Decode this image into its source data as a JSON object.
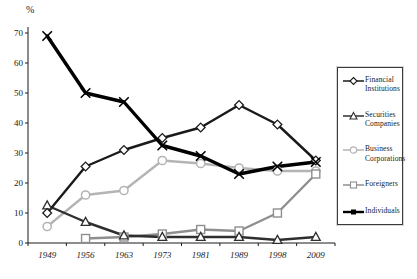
{
  "chart_data": {
    "type": "line",
    "title": "",
    "unit_label": "%",
    "xlabel": "",
    "ylabel": "%",
    "ylim": [
      0,
      70
    ],
    "yticks": [
      0,
      10,
      20,
      30,
      40,
      50,
      60,
      70
    ],
    "grid": false,
    "legend_position": "right",
    "categories": [
      "1949",
      "1956",
      "1963",
      "1973",
      "1981",
      "1989",
      "1998",
      "2009"
    ],
    "series": [
      {
        "name": "Business Corporations",
        "marker": "circle",
        "color": "#b4b4b4",
        "line_width": 2.4,
        "values": [
          5.5,
          16,
          17.5,
          27.5,
          26.5,
          25,
          24,
          24
        ]
      },
      {
        "name": "Foreigners",
        "marker": "square",
        "color": "#8f8f8f",
        "line_width": 2.4,
        "values": [
          null,
          1.5,
          2,
          3,
          4.5,
          4,
          10,
          23
        ]
      },
      {
        "name": "Securities Companies",
        "marker": "triangle",
        "color": "#2f2f2f",
        "line_width": 2.4,
        "values": [
          12.5,
          7,
          2.5,
          2,
          2,
          2,
          1,
          2
        ]
      },
      {
        "name": "Financial Institutions",
        "marker": "diamond",
        "color": "#1a1a1a",
        "line_width": 2.4,
        "values": [
          10,
          25.5,
          31,
          35,
          38.5,
          46,
          39.5,
          27.5
        ]
      },
      {
        "name": "Individuals",
        "marker": "x",
        "legend_marker": "filled-square",
        "color": "#000000",
        "line_width": 3.4,
        "values": [
          69,
          50,
          47,
          32.5,
          29,
          23,
          25.5,
          27
        ]
      }
    ],
    "legend_order": [
      "Financial Institutions",
      "Securities Companies",
      "Business Corporations",
      "Foreigners",
      "Individuals"
    ]
  }
}
